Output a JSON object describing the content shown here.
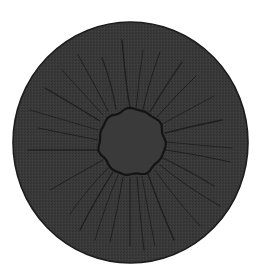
{
  "canvas": {
    "width": 266,
    "height": 279,
    "background": "#ffffff"
  },
  "disc": {
    "cx": 130.5,
    "cy": 142.5,
    "rx": 117.5,
    "ry": 120.5,
    "fill": "#393939",
    "rim_color": "#1c1c1c",
    "rim_width": 1.6
  },
  "inner_ring": {
    "cx": 132,
    "cy": 142,
    "r": 33,
    "fill": "#3a3a3a",
    "stroke": "#141414",
    "stroke_width": 2.2,
    "wobble": 1.6,
    "points": 48
  },
  "cracks": {
    "color": "#1e1e1e",
    "width": 1.1,
    "lines": [
      [
        [
          130,
          108
        ],
        [
          126,
          80
        ],
        [
          122,
          40
        ]
      ],
      [
        [
          136,
          109
        ],
        [
          139,
          80
        ],
        [
          143,
          50
        ]
      ],
      [
        [
          143,
          110
        ],
        [
          150,
          82
        ],
        [
          160,
          52
        ]
      ],
      [
        [
          150,
          112
        ],
        [
          166,
          86
        ],
        [
          182,
          62
        ]
      ],
      [
        [
          157,
          117
        ],
        [
          176,
          96
        ],
        [
          196,
          76
        ]
      ],
      [
        [
          162,
          124
        ],
        [
          188,
          110
        ],
        [
          214,
          96
        ]
      ],
      [
        [
          165,
          133
        ],
        [
          194,
          126
        ],
        [
          222,
          120
        ]
      ],
      [
        [
          166,
          142
        ],
        [
          198,
          145
        ],
        [
          232,
          148
        ]
      ],
      [
        [
          165,
          150
        ],
        [
          196,
          155
        ],
        [
          230,
          162
        ]
      ],
      [
        [
          163,
          158
        ],
        [
          190,
          172
        ],
        [
          214,
          186
        ]
      ],
      [
        [
          160,
          165
        ],
        [
          188,
          186
        ],
        [
          220,
          206
        ]
      ],
      [
        [
          155,
          170
        ],
        [
          176,
          198
        ],
        [
          200,
          226
        ]
      ],
      [
        [
          148,
          174
        ],
        [
          160,
          206
        ],
        [
          174,
          240
        ]
      ],
      [
        [
          142,
          176
        ],
        [
          148,
          210
        ],
        [
          155,
          246
        ]
      ],
      [
        [
          137,
          177
        ],
        [
          140,
          212
        ],
        [
          144,
          250
        ]
      ],
      [
        [
          130,
          178
        ],
        [
          130,
          212
        ],
        [
          130,
          246
        ]
      ],
      [
        [
          123,
          177
        ],
        [
          117,
          210
        ],
        [
          110,
          242
        ]
      ],
      [
        [
          118,
          175
        ],
        [
          106,
          206
        ],
        [
          95,
          240
        ]
      ],
      [
        [
          113,
          172
        ],
        [
          96,
          200
        ],
        [
          80,
          230
        ]
      ],
      [
        [
          108,
          168
        ],
        [
          88,
          190
        ],
        [
          70,
          214
        ]
      ],
      [
        [
          103,
          160
        ],
        [
          76,
          175
        ],
        [
          50,
          190
        ]
      ],
      [
        [
          99,
          150
        ],
        [
          64,
          150
        ],
        [
          28,
          150
        ]
      ],
      [
        [
          98,
          140
        ],
        [
          68,
          134
        ],
        [
          38,
          128
        ]
      ],
      [
        [
          98,
          130
        ],
        [
          64,
          120
        ],
        [
          30,
          110
        ]
      ],
      [
        [
          100,
          121
        ],
        [
          72,
          104
        ],
        [
          45,
          88
        ]
      ],
      [
        [
          103,
          115
        ],
        [
          82,
          92
        ],
        [
          62,
          70
        ]
      ],
      [
        [
          108,
          111
        ],
        [
          94,
          84
        ],
        [
          78,
          55
        ]
      ],
      [
        [
          116,
          109
        ],
        [
          110,
          82
        ],
        [
          102,
          58
        ]
      ]
    ]
  },
  "icons": {
    "scene": "cracked-disc-illustration"
  }
}
